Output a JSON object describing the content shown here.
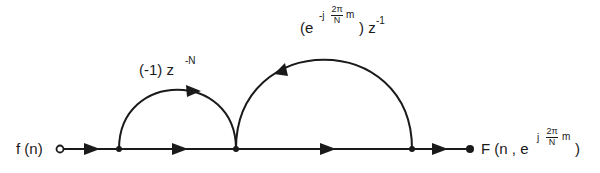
{
  "diagram": {
    "type": "signal-flow-graph",
    "stroke_color": "#1a1a1a",
    "background": "#ffffff",
    "input": {
      "label": "f (n)",
      "node_style": "open-circle"
    },
    "output": {
      "label_prefix": "F (n , e",
      "exp_prefix": "j",
      "exp_num": "2π",
      "exp_den": "N",
      "exp_suffix": "m",
      "label_suffix": ")",
      "node_style": "filled-dot"
    },
    "branches": [
      {
        "id": "feedforward",
        "gain_base": "(-1) z",
        "gain_exp": "-N",
        "direction": "forward",
        "from_node": 1,
        "to_node": 2
      },
      {
        "id": "feedback",
        "gain_open": "(e",
        "gain_exp_prefix": "-j",
        "gain_exp_num": "2π",
        "gain_exp_den": "N",
        "gain_exp_suffix": "m",
        "gain_close": ") z",
        "gain_z_exp": "-1",
        "direction": "backward",
        "from_node": 3,
        "to_node": 2
      }
    ],
    "nodes": [
      {
        "id": 0,
        "x": 60,
        "y": 149,
        "role": "input"
      },
      {
        "id": 1,
        "x": 119,
        "y": 149,
        "role": "branch"
      },
      {
        "id": 2,
        "x": 236,
        "y": 149,
        "role": "sum"
      },
      {
        "id": 3,
        "x": 412,
        "y": 149,
        "role": "branch"
      },
      {
        "id": 4,
        "x": 470,
        "y": 149,
        "role": "output"
      }
    ]
  }
}
